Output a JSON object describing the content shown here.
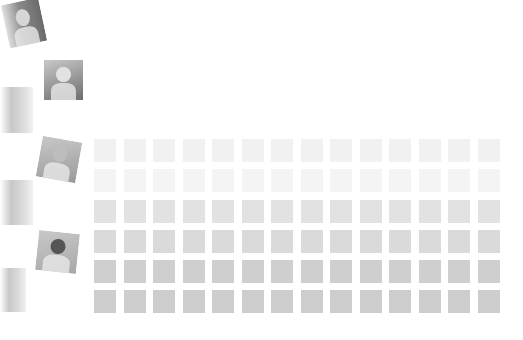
{
  "gallery": {
    "photos": [
      {
        "name": "photo-clown-child",
        "left": 4,
        "top": 0,
        "w": 40,
        "h": 46,
        "rot": -12,
        "tone": "#8a8a8a",
        "head": "#d6d6d6",
        "blur": true
      },
      {
        "name": "photo-girl-with-book",
        "left": 43,
        "top": 59,
        "w": 41,
        "h": 42,
        "rot": 0,
        "tone": "#6e6e6e",
        "head": "#e2e2e2",
        "blur": false
      },
      {
        "name": "photo-face-closeup",
        "left": 38,
        "top": 138,
        "w": 42,
        "h": 43,
        "rot": 10,
        "tone": "#9a9a9a",
        "head": "#bdbdbd",
        "blur": false
      },
      {
        "name": "photo-two-people",
        "left": 36,
        "top": 231,
        "w": 43,
        "h": 42,
        "rot": 6,
        "tone": "#a8a8a8",
        "head": "#555555",
        "blur": false
      }
    ],
    "blurred_fragments": [
      {
        "name": "blurred-photo-fragment-1",
        "top": 87,
        "h": 46,
        "w": 33
      },
      {
        "name": "blurred-photo-fragment-2",
        "top": 180,
        "h": 45,
        "w": 33
      },
      {
        "name": "blurred-photo-fragment-3",
        "top": 268,
        "h": 44,
        "w": 26
      }
    ]
  },
  "thumbnail_grid": {
    "columns": 14,
    "rows": 6,
    "row_colors": [
      "#f1f1f1",
      "#f4f4f4",
      "#e2e2e2",
      "#dadada",
      "#cfcfcf",
      "#cdcdcd"
    ]
  }
}
